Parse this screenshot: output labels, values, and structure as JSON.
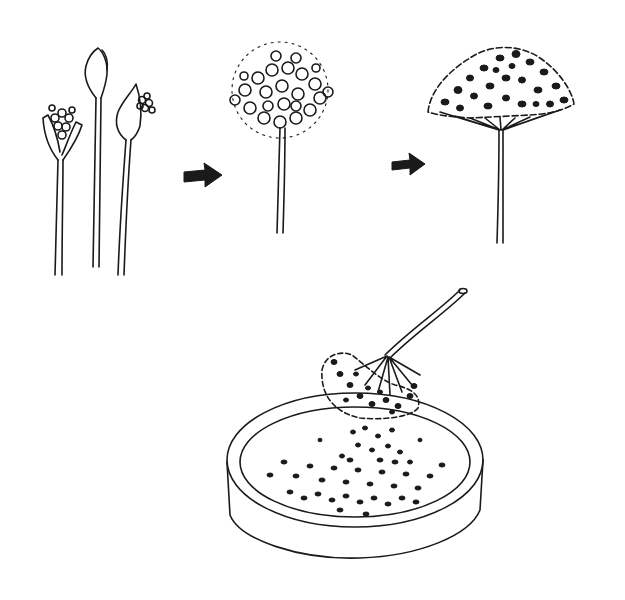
{
  "diagram": {
    "stages": [
      {
        "id": "buds",
        "description": "Three stems with flower buds opening"
      },
      {
        "id": "bloom",
        "description": "Full round flower head in bloom"
      },
      {
        "id": "seed-head",
        "description": "Dome-shaped seed head with dark seeds"
      },
      {
        "id": "harvest",
        "description": "Seed head shaken over a shallow dish, seeds falling in"
      }
    ],
    "arrows": [
      {
        "from": "buds",
        "to": "bloom"
      },
      {
        "from": "bloom",
        "to": "seed-head"
      }
    ],
    "colors": {
      "ink": "#1a1a1a",
      "background": "#ffffff"
    }
  }
}
